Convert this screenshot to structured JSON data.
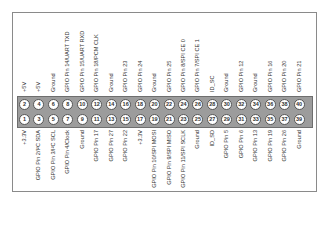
{
  "diagram": {
    "colors": {
      "header": "#9c9c9c",
      "pin": "#ffffff",
      "frame": "#8a8a8a",
      "text": "#333333"
    },
    "top_row": [
      {
        "pin": "2",
        "label": "+5V"
      },
      {
        "pin": "4",
        "label": "+5V"
      },
      {
        "pin": "6",
        "label": "Ground"
      },
      {
        "pin": "8",
        "label": "GPIO Pin 14/UART TXD"
      },
      {
        "pin": "10",
        "label": "GPIO Pin 15/UART RXD"
      },
      {
        "pin": "12",
        "label": "GPIO Pin 18/PCM CLK"
      },
      {
        "pin": "14",
        "label": "Ground"
      },
      {
        "pin": "16",
        "label": "GPIO Pin 23"
      },
      {
        "pin": "18",
        "label": "GPIO Pin 24"
      },
      {
        "pin": "20",
        "label": "Ground"
      },
      {
        "pin": "22",
        "label": "GPIO Pin 25"
      },
      {
        "pin": "24",
        "label": "GPIO Pin 8/SPI CE 0"
      },
      {
        "pin": "26",
        "label": "GPIO Pin 7/SPI CE 1"
      },
      {
        "pin": "28",
        "label": "ID_SC"
      },
      {
        "pin": "30",
        "label": "Ground"
      },
      {
        "pin": "32",
        "label": "GPIO Pin 12"
      },
      {
        "pin": "34",
        "label": "Ground"
      },
      {
        "pin": "36",
        "label": "GPIO Pin 16"
      },
      {
        "pin": "38",
        "label": "GPIO Pin 20"
      },
      {
        "pin": "40",
        "label": "GPIO Pin 21"
      }
    ],
    "bottom_row": [
      {
        "pin": "1",
        "label": "+3.3V"
      },
      {
        "pin": "3",
        "label": "GPIO Pin 2/I²C SDA"
      },
      {
        "pin": "5",
        "label": "GPIO Pin 3/I²C SCL"
      },
      {
        "pin": "7",
        "label": "GPIO Pin 4/Clock"
      },
      {
        "pin": "9",
        "label": "Ground"
      },
      {
        "pin": "11",
        "label": "GPIO Pin 17"
      },
      {
        "pin": "13",
        "label": "GPIO Pin 27"
      },
      {
        "pin": "15",
        "label": "GPIO Pin 22"
      },
      {
        "pin": "17",
        "label": "+3.3V"
      },
      {
        "pin": "19",
        "label": "GPIO Pin 10/SPI MOSI"
      },
      {
        "pin": "21",
        "label": "GPIO Pin 9/SPI MISO"
      },
      {
        "pin": "23",
        "label": "GPIO Pin 11/SPI SCLK"
      },
      {
        "pin": "25",
        "label": "Ground"
      },
      {
        "pin": "27",
        "label": "ID_SD"
      },
      {
        "pin": "29",
        "label": "GPIO Pin 5"
      },
      {
        "pin": "31",
        "label": "GPIO Pin 6"
      },
      {
        "pin": "33",
        "label": "GPIO Pin 13"
      },
      {
        "pin": "35",
        "label": "GPIO Pin 19"
      },
      {
        "pin": "37",
        "label": "GPIO Pin 26"
      },
      {
        "pin": "39",
        "label": "Ground"
      }
    ]
  }
}
